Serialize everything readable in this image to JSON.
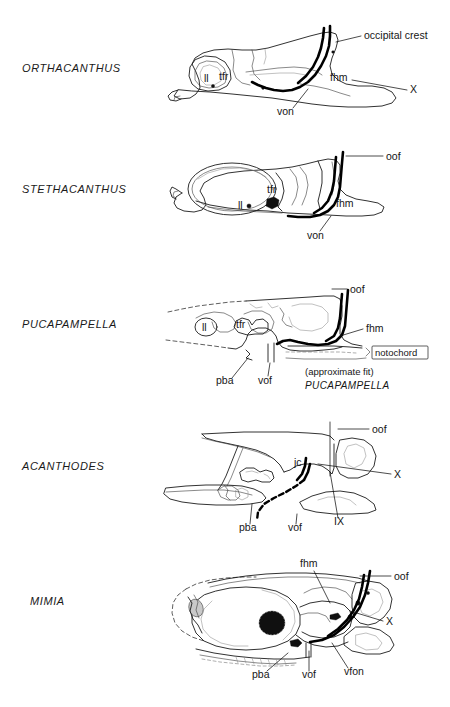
{
  "figure": {
    "type": "comparative-anatomy-diagram",
    "background_color": "#ffffff",
    "ink_color": "#1b1b1b"
  },
  "panels": [
    {
      "id": "orthacanthus",
      "taxon": "ORTHACANTHUS",
      "annotations": [
        {
          "key": "occipital_crest",
          "text": "occipital crest"
        },
        {
          "key": "ll",
          "text": "ll"
        },
        {
          "key": "tfr",
          "text": "tfr"
        },
        {
          "key": "fhm",
          "text": "fhm"
        },
        {
          "key": "x",
          "text": "X"
        },
        {
          "key": "von",
          "text": "von"
        }
      ]
    },
    {
      "id": "stethacanthus",
      "taxon": "STETHACANTHUS",
      "annotations": [
        {
          "key": "oof",
          "text": "oof"
        },
        {
          "key": "tfr",
          "text": "tfr"
        },
        {
          "key": "ll",
          "text": "ll"
        },
        {
          "key": "fhm",
          "text": "fhm"
        },
        {
          "key": "von",
          "text": "von"
        }
      ]
    },
    {
      "id": "pucapampella",
      "taxon": "PUCAPAMPELLA",
      "annotations": [
        {
          "key": "oof",
          "text": "oof"
        },
        {
          "key": "ll",
          "text": "ll"
        },
        {
          "key": "tfr",
          "text": "tfr"
        },
        {
          "key": "fhm",
          "text": "fhm"
        },
        {
          "key": "notochord",
          "text": "notochord"
        },
        {
          "key": "pba",
          "text": "pba"
        },
        {
          "key": "vof",
          "text": "vof"
        }
      ],
      "caption_line1": "(approximate fit)",
      "caption_line2": "PUCAPAMPELLA"
    },
    {
      "id": "acanthodes",
      "taxon": "ACANTHODES",
      "annotations": [
        {
          "key": "oof",
          "text": "oof"
        },
        {
          "key": "jc",
          "text": "jc"
        },
        {
          "key": "x",
          "text": "X"
        },
        {
          "key": "ix",
          "text": "IX"
        },
        {
          "key": "pba",
          "text": "pba"
        },
        {
          "key": "vof",
          "text": "vof"
        }
      ]
    },
    {
      "id": "mimia",
      "taxon": "MIMIA",
      "annotations": [
        {
          "key": "fhm",
          "text": "fhm"
        },
        {
          "key": "oof",
          "text": "oof"
        },
        {
          "key": "x",
          "text": "X"
        },
        {
          "key": "pba",
          "text": "pba"
        },
        {
          "key": "vof",
          "text": "vof"
        },
        {
          "key": "vfon",
          "text": "vfon"
        }
      ]
    }
  ]
}
